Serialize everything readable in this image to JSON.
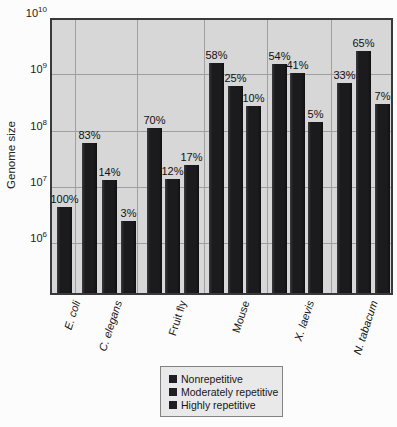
{
  "figure": {
    "y_axis_title": "Genome size"
  },
  "legend": {
    "items": [
      {
        "label": "Nonrepetitive"
      },
      {
        "label": "Moderately repetitive"
      },
      {
        "label": "Highly repetitive"
      }
    ],
    "marker_color": "#1f1f23"
  },
  "chart_data": {
    "type": "bar",
    "scale": "log",
    "title": "",
    "xlabel": "",
    "ylabel": "Genome size",
    "ylim": [
      100000,
      10000000000
    ],
    "y_tick_exponents": [
      10,
      9,
      8,
      7,
      6
    ],
    "grid": true,
    "legend_position": "bottom-center",
    "bar_classes": [
      "Nonrepetitive",
      "Moderately repetitive",
      "Highly repetitive"
    ],
    "categories": [
      "E. coli",
      "C. elegans",
      "Fruit fly",
      "Mouse",
      "X. laevis",
      "N. tabacum"
    ],
    "groups": [
      {
        "category": "E. coli",
        "italic": true,
        "bars": [
          {
            "class": "Nonrepetitive",
            "label": "100%",
            "value": 4400000.0
          }
        ]
      },
      {
        "category": "C. elegans",
        "italic": true,
        "bars": [
          {
            "class": "Nonrepetitive",
            "label": "83%",
            "value": 60000000.0
          },
          {
            "class": "Moderately repetitive",
            "label": "14%",
            "value": 13000000.0
          },
          {
            "class": "Highly repetitive",
            "label": "3%",
            "value": 2500000.0
          }
        ]
      },
      {
        "category": "Fruit fly",
        "italic": false,
        "bars": [
          {
            "class": "Nonrepetitive",
            "label": "70%",
            "value": 110000000.0
          },
          {
            "class": "Moderately repetitive",
            "label": "12%",
            "value": 14000000.0
          },
          {
            "class": "Highly repetitive",
            "label": "17%",
            "value": 24000000.0
          }
        ]
      },
      {
        "category": "Mouse",
        "italic": false,
        "bars": [
          {
            "class": "Nonrepetitive",
            "label": "58%",
            "value": 1600000000.0
          },
          {
            "class": "Moderately repetitive",
            "label": "25%",
            "value": 620000000.0
          },
          {
            "class": "Highly repetitive",
            "label": "10%",
            "value": 270000000.0
          }
        ]
      },
      {
        "category": "X. laevis",
        "italic": true,
        "bars": [
          {
            "class": "Nonrepetitive",
            "label": "54%",
            "value": 1500000000.0
          },
          {
            "class": "Moderately repetitive",
            "label": "41%",
            "value": 1050000000.0
          },
          {
            "class": "Highly repetitive",
            "label": "5%",
            "value": 140000000.0
          }
        ]
      },
      {
        "category": "N. tabacum",
        "italic": true,
        "bars": [
          {
            "class": "Nonrepetitive",
            "label": "33%",
            "value": 700000000.0
          },
          {
            "class": "Moderately repetitive",
            "label": "65%",
            "value": 2600000000.0
          },
          {
            "class": "Highly repetitive",
            "label": "7%",
            "value": 300000000.0
          }
        ]
      }
    ],
    "colors": {
      "bar": "#1b1b1e",
      "plot_bg": "#d7d7d7",
      "grid": "#9f9f9f"
    }
  }
}
